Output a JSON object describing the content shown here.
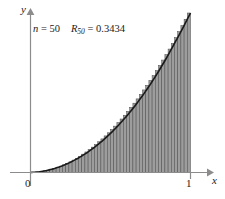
{
  "figure": {
    "annotation": {
      "n_symbol": "n",
      "n_equals": " = ",
      "n_value": "50",
      "r_symbol": "R",
      "r_subscript": "50",
      "r_equals": " = ",
      "r_value": "0.3434"
    },
    "axes": {
      "y_label": "y",
      "x_label": "x",
      "origin_label": "0",
      "x_tick_label": "1"
    },
    "colors": {
      "background": "#ffffff",
      "axis": "#8c8c8c",
      "curve": "#1a1a1a",
      "bar_fill": "#9d9d9d",
      "bar_edge": "#4a4a4a",
      "text": "#1a1a1a"
    }
  },
  "chart_data": {
    "type": "bar",
    "title": "",
    "subtitle": "",
    "xlabel": "x",
    "ylabel": "y",
    "xlim": [
      0,
      1
    ],
    "ylim": [
      0,
      1
    ],
    "grid": false,
    "legend": null,
    "n_rectangles": 50,
    "rule": "right-endpoint",
    "riemann_sum": 0.3434,
    "annotations": [
      "n = 50",
      "R50 = 0.3434"
    ],
    "curve": {
      "name": "f(x)",
      "x": [
        0,
        0.05,
        0.1,
        0.15,
        0.2,
        0.25,
        0.3,
        0.35,
        0.4,
        0.45,
        0.5,
        0.55,
        0.6,
        0.65,
        0.7,
        0.75,
        0.8,
        0.85,
        0.9,
        0.95,
        1
      ],
      "y": [
        0,
        0.0035,
        0.012,
        0.025,
        0.042,
        0.064,
        0.091,
        0.122,
        0.158,
        0.199,
        0.245,
        0.296,
        0.352,
        0.414,
        0.481,
        0.554,
        0.633,
        0.718,
        0.809,
        0.902,
        1
      ]
    },
    "categories": [
      0.02,
      0.04,
      0.06,
      0.08,
      0.1,
      0.12,
      0.14,
      0.16,
      0.18,
      0.2,
      0.22,
      0.24,
      0.26,
      0.28,
      0.3,
      0.32,
      0.34,
      0.36,
      0.38,
      0.4,
      0.42,
      0.44,
      0.46,
      0.48,
      0.5,
      0.52,
      0.54,
      0.56,
      0.58,
      0.6,
      0.62,
      0.64,
      0.66,
      0.68,
      0.7,
      0.72,
      0.74,
      0.76,
      0.78,
      0.8,
      0.82,
      0.84,
      0.86,
      0.88,
      0.9,
      0.92,
      0.94,
      0.96,
      0.98,
      1
    ],
    "values": [
      0.0006,
      0.0023,
      0.0051,
      0.0091,
      0.0142,
      0.0205,
      0.0279,
      0.0365,
      0.0463,
      0.0572,
      0.0692,
      0.0824,
      0.0968,
      0.1123,
      0.129,
      0.1468,
      0.1658,
      0.1859,
      0.2072,
      0.2297,
      0.2533,
      0.2781,
      0.304,
      0.3311,
      0.3594,
      0.3888,
      0.4194,
      0.4511,
      0.484,
      0.5181,
      0.5533,
      0.5897,
      0.6272,
      0.6659,
      0.7058,
      0.7468,
      0.789,
      0.8323,
      0.8768,
      0.9225,
      0.9693,
      1.0173,
      1.0664,
      1.1167,
      1.1682,
      1.2208,
      1.2746,
      1.3295,
      1.3856,
      1.4429
    ]
  }
}
